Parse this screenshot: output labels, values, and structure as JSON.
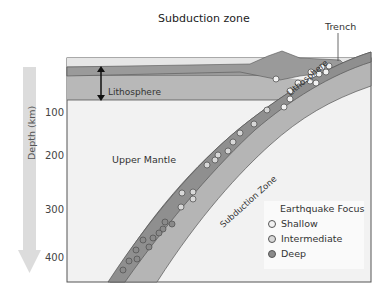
{
  "title": "Subduction zone",
  "labels": {
    "trench": "Trench",
    "lithosphere_left": "Lithosphere",
    "lithosphere_slab": "Lithosphere",
    "upper_mantle": "Upper Mantle",
    "subduction_zone": "Subduction Zone"
  },
  "depth_axis": {
    "label": "Depth (km)",
    "ticks": [
      "100",
      "200",
      "300",
      "400"
    ]
  },
  "legend": {
    "title": "Earthquake Focus",
    "items": [
      {
        "label": "Shallow",
        "color": "#f2f2f2"
      },
      {
        "label": "Intermediate",
        "color": "#d8d8d8"
      },
      {
        "label": "Deep",
        "color": "#8a8a8a"
      }
    ]
  },
  "colors": {
    "ocean_water": "#e6e6e6",
    "crust": "#9a9a9a",
    "lithosphere": "#b8b8b8",
    "mantle": "#f2f2f2",
    "slab_upper": "#8f8f8f",
    "slab_lower": "#b5b5b5",
    "arrow": "#dcdcdc"
  }
}
